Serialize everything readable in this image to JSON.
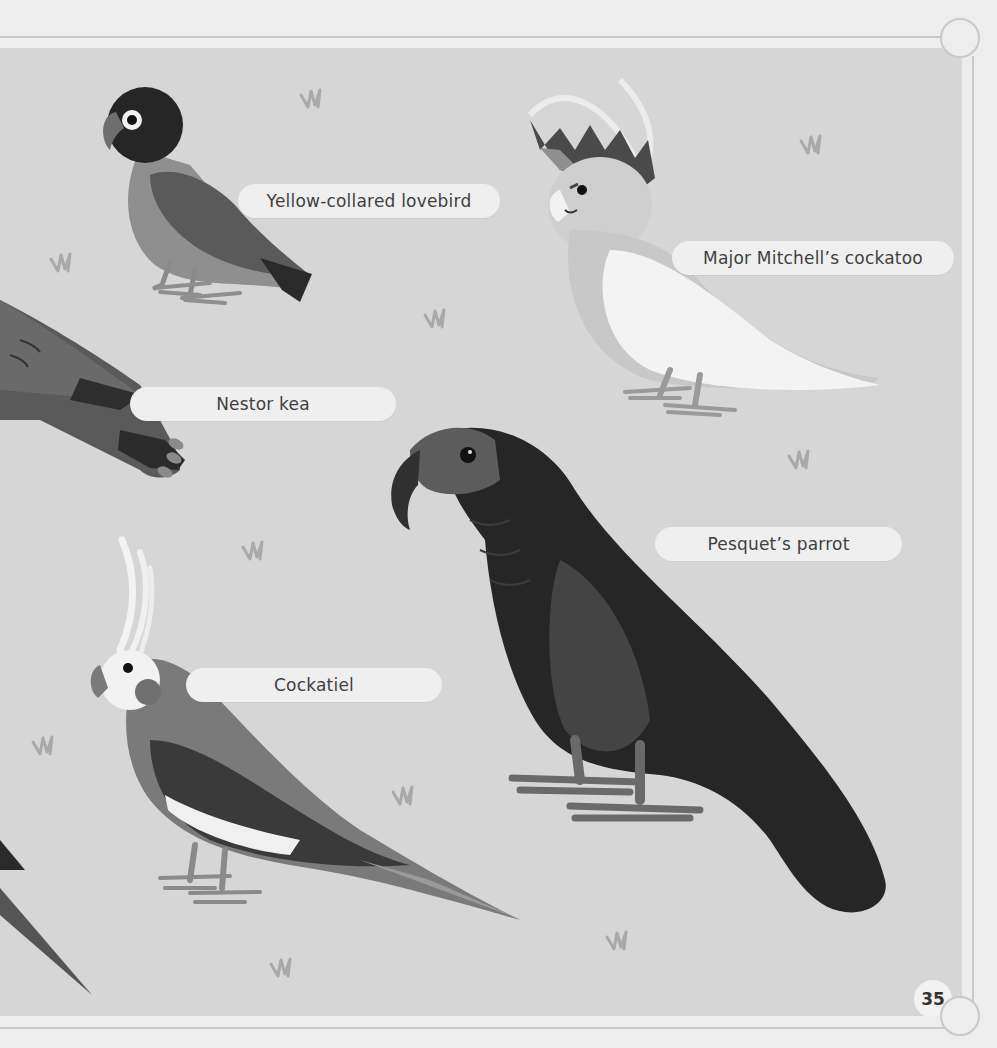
{
  "page": {
    "number": "35",
    "background_color": "#d6d6d6",
    "frame_color": "#ededed"
  },
  "birds": [
    {
      "id": "yellow-collared-lovebird",
      "label": "Yellow-collared lovebird"
    },
    {
      "id": "major-mitchells-cockatoo",
      "label": "Major Mitchell’s cockatoo"
    },
    {
      "id": "nestor-kea",
      "label": "Nestor kea"
    },
    {
      "id": "pesquets-parrot",
      "label": "Pesquet’s parrot"
    },
    {
      "id": "cockatiel",
      "label": "Cockatiel"
    }
  ],
  "decorations": {
    "grass_tuft_icon": "grass-tuft-icon",
    "grass_tufts": [
      {
        "x": 298,
        "y": 86
      },
      {
        "x": 798,
        "y": 132
      },
      {
        "x": 48,
        "y": 250
      },
      {
        "x": 422,
        "y": 306
      },
      {
        "x": 786,
        "y": 447
      },
      {
        "x": 240,
        "y": 538
      },
      {
        "x": 30,
        "y": 733
      },
      {
        "x": 390,
        "y": 783
      },
      {
        "x": 604,
        "y": 928
      },
      {
        "x": 268,
        "y": 955
      }
    ]
  }
}
